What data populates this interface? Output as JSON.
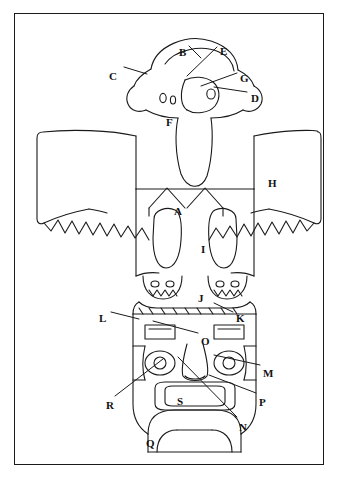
{
  "figure": {
    "frame_color": "#1a1a1a",
    "line_color": "#1a1a1a",
    "background_color": "#ffffff"
  },
  "labels": [
    {
      "id": "A",
      "text": "A",
      "x": 173,
      "y": 201
    },
    {
      "id": "B",
      "text": "B",
      "x": 178,
      "y": 42
    },
    {
      "id": "C",
      "text": "C",
      "x": 108,
      "y": 66
    },
    {
      "id": "D",
      "text": "D",
      "x": 250,
      "y": 88
    },
    {
      "id": "E",
      "text": "E",
      "x": 219,
      "y": 41
    },
    {
      "id": "F",
      "text": "F",
      "x": 165,
      "y": 112
    },
    {
      "id": "G",
      "text": "G",
      "x": 239,
      "y": 68
    },
    {
      "id": "H",
      "text": "H",
      "x": 267,
      "y": 173
    },
    {
      "id": "I",
      "text": "I",
      "x": 200,
      "y": 239
    },
    {
      "id": "J",
      "text": "J",
      "x": 197,
      "y": 288
    },
    {
      "id": "K",
      "text": "K",
      "x": 235,
      "y": 308
    },
    {
      "id": "L",
      "text": "L",
      "x": 98,
      "y": 308
    },
    {
      "id": "M",
      "text": "M",
      "x": 262,
      "y": 363
    },
    {
      "id": "N",
      "text": "N",
      "x": 238,
      "y": 417
    },
    {
      "id": "O",
      "text": "O",
      "x": 200,
      "y": 331
    },
    {
      "id": "P",
      "text": "P",
      "x": 258,
      "y": 392
    },
    {
      "id": "R",
      "text": "R",
      "x": 105,
      "y": 395
    },
    {
      "id": "Q",
      "text": "Q",
      "x": 145,
      "y": 433
    },
    {
      "id": "S",
      "text": "S",
      "x": 176,
      "y": 391
    }
  ],
  "leaders": [
    {
      "from": "C",
      "x1": 123,
      "y1": 66,
      "x2": 146,
      "y2": 73
    },
    {
      "from": "B",
      "x1": 188,
      "y1": 43,
      "x2": 200,
      "y2": 55
    },
    {
      "from": "E",
      "x1": 216,
      "y1": 44,
      "x2": 186,
      "y2": 73
    },
    {
      "from": "G",
      "x1": 236,
      "y1": 70,
      "x2": 200,
      "y2": 83
    },
    {
      "from": "D",
      "x1": 246,
      "y1": 89,
      "x2": 213,
      "y2": 84
    },
    {
      "from": "L",
      "x1": 110,
      "y1": 309,
      "x2": 138,
      "y2": 316
    },
    {
      "from": "K",
      "x1": 232,
      "y1": 309,
      "x2": 213,
      "y2": 300
    },
    {
      "from": "O",
      "x1": 197,
      "y1": 330,
      "x2": 152,
      "y2": 318
    },
    {
      "from": "M",
      "x1": 259,
      "y1": 362,
      "x2": 213,
      "y2": 352
    },
    {
      "from": "P",
      "x1": 255,
      "y1": 390,
      "x2": 208,
      "y2": 372
    },
    {
      "from": "N",
      "x1": 236,
      "y1": 414,
      "x2": 177,
      "y2": 354
    },
    {
      "from": "R",
      "x1": 114,
      "y1": 393,
      "x2": 162,
      "y2": 356
    }
  ]
}
